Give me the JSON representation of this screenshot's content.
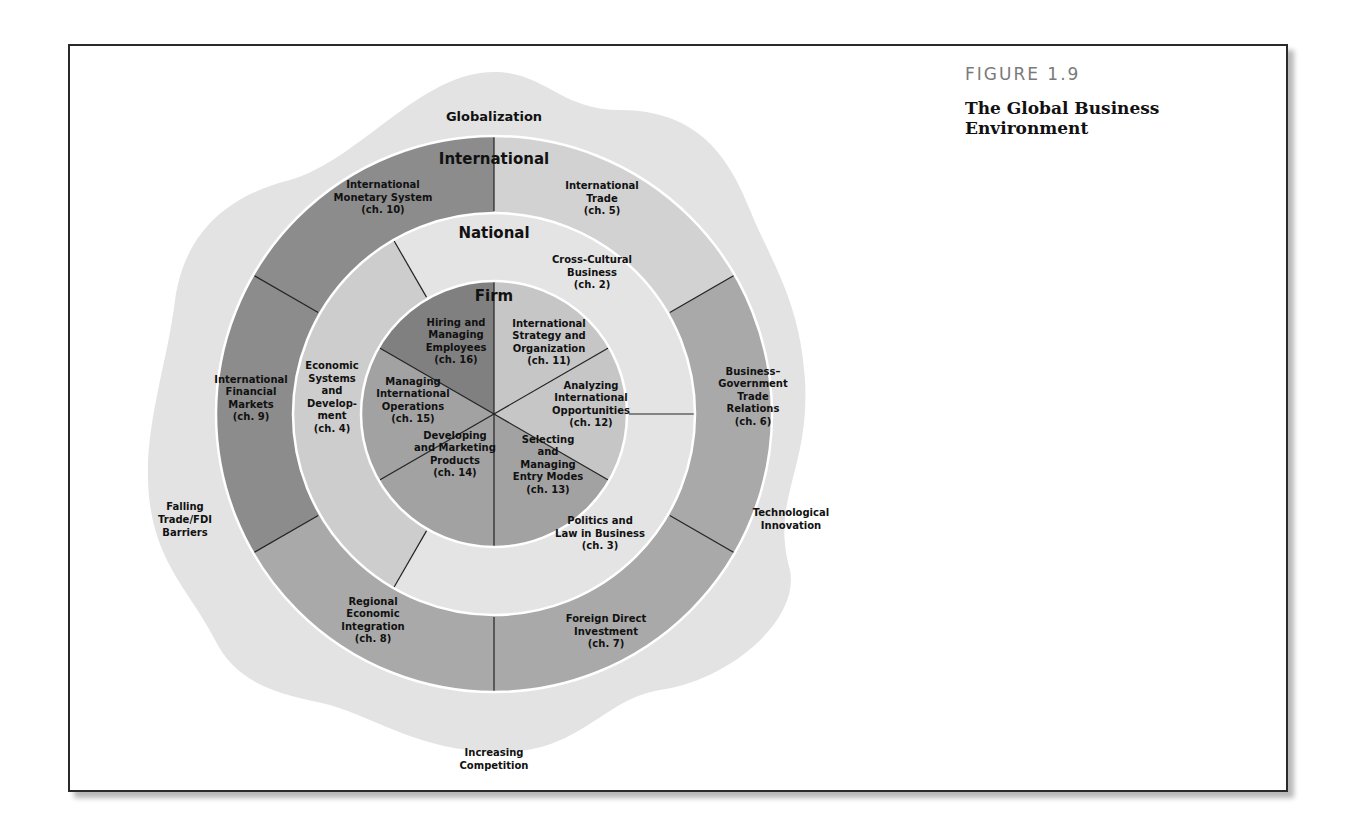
{
  "figure": {
    "number": "FIGURE 1.9",
    "title": "The Global Business Environment"
  },
  "colors": {
    "outer": "#e3e3e3",
    "separator": "#ffffff",
    "divider": "#222222",
    "international_dark": "#8c8c8c",
    "international_mid": "#a9a9a9",
    "international_light": "#d2d2d2",
    "national_light": "#e4e4e4",
    "national_mid": "#cdcdcd",
    "firm_dark": "#808080",
    "firm_mid": "#a2a2a2",
    "firm_light": "#c6c6c6"
  },
  "forces": {
    "top": "Globalization",
    "right": [
      "Technological",
      "Innovation"
    ],
    "bottom": [
      "Increasing",
      "Competition"
    ],
    "left": [
      "Falling",
      "Trade/FDI",
      "Barriers"
    ]
  },
  "rings": {
    "international": {
      "title": "International",
      "sectors": [
        {
          "lines": [
            "International",
            "Trade",
            "(ch. 5)"
          ]
        },
        {
          "lines": [
            "Business–",
            "Government",
            "Trade",
            "Relations",
            "(ch. 6)"
          ]
        },
        {
          "lines": [
            "Foreign Direct",
            "Investment",
            "(ch. 7)"
          ]
        },
        {
          "lines": [
            "Regional",
            "Economic",
            "Integration",
            "(ch. 8)"
          ]
        },
        {
          "lines": [
            "International",
            "Financial",
            "Markets",
            "(ch. 9)"
          ]
        },
        {
          "lines": [
            "International",
            "Monetary System",
            "(ch. 10)"
          ]
        }
      ]
    },
    "national": {
      "title": "National",
      "sectors": [
        {
          "lines": [
            "Cross-Cultural",
            "Business",
            "(ch. 2)"
          ]
        },
        {
          "lines": [
            "Politics and",
            "Law in Business",
            "(ch. 3)"
          ]
        },
        {
          "lines": [
            "Economic",
            "Systems",
            "and",
            "Develop-",
            "ment",
            "(ch. 4)"
          ]
        }
      ]
    },
    "firm": {
      "title": "Firm",
      "sectors": [
        {
          "lines": [
            "International",
            "Strategy and",
            "Organization",
            "(ch. 11)"
          ]
        },
        {
          "lines": [
            "Analyzing",
            "International",
            "Opportunities",
            "(ch. 12)"
          ]
        },
        {
          "lines": [
            "Selecting",
            "and",
            "Managing",
            "Entry Modes",
            "(ch. 13)"
          ]
        },
        {
          "lines": [
            "Developing",
            "and Marketing",
            "Products",
            "(ch. 14)"
          ]
        },
        {
          "lines": [
            "Managing",
            "International",
            "Operations",
            "(ch. 15)"
          ]
        },
        {
          "lines": [
            "Hiring and",
            "Managing",
            "Employees",
            "(ch. 16)"
          ]
        }
      ]
    }
  }
}
